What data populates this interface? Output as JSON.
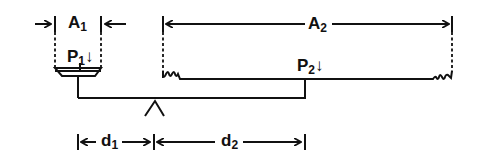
{
  "diagram": {
    "labels": {
      "a1": {
        "main": "A",
        "sub": "1"
      },
      "a2": {
        "main": "A",
        "sub": "2"
      },
      "p1": {
        "main": "P",
        "sub": "1",
        "arrow": "↓"
      },
      "p2": {
        "main": "P",
        "sub": "2",
        "arrow": "↓"
      },
      "d1": {
        "main": "d",
        "sub": "1"
      },
      "d2": {
        "main": "d",
        "sub": "2"
      }
    },
    "colors": {
      "ink": "#111111",
      "background": "#ffffff"
    }
  }
}
